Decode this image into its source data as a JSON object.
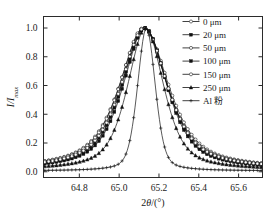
{
  "chart_data": {
    "type": "line",
    "title": "",
    "xlabel": "2θ/(°)",
    "ylabel": "I/I",
    "ylabel_sub": "max",
    "xlim": [
      64.62,
      65.72
    ],
    "ylim": [
      -0.04,
      1.08
    ],
    "xticks": [
      64.8,
      65.0,
      65.2,
      65.4,
      65.6
    ],
    "xtick_labels": [
      "64.8",
      "65.0",
      "65.2",
      "65.4",
      "65.6"
    ],
    "yticks": [
      0.0,
      0.2,
      0.4,
      0.6,
      0.8,
      1.0
    ],
    "ytick_labels": [
      "0.0",
      "0.2",
      "0.4",
      "0.6",
      "0.8",
      "1.0"
    ],
    "grid": false,
    "legend_position": "top-right",
    "peak_center": 65.13,
    "series": [
      {
        "name": "0 μm",
        "marker": "open-circle",
        "fwhm": 0.295,
        "center": 65.125,
        "amplitude": 1.0,
        "baseline": 0.018,
        "shape": 0.72
      },
      {
        "name": "20 μm",
        "marker": "filled-square",
        "fwhm": 0.272,
        "center": 65.128,
        "amplitude": 1.0,
        "baseline": 0.016,
        "shape": 0.7
      },
      {
        "name": "50 μm",
        "marker": "open-circle",
        "fwhm": 0.286,
        "center": 65.122,
        "amplitude": 1.0,
        "baseline": 0.018,
        "shape": 0.72
      },
      {
        "name": "100 μm",
        "marker": "filled-square",
        "fwhm": 0.262,
        "center": 65.13,
        "amplitude": 1.0,
        "baseline": 0.015,
        "shape": 0.68
      },
      {
        "name": "150 μm",
        "marker": "open-circle",
        "fwhm": 0.278,
        "center": 65.126,
        "amplitude": 1.0,
        "baseline": 0.017,
        "shape": 0.71
      },
      {
        "name": "250 μm",
        "marker": "filled-triangle",
        "fwhm": 0.215,
        "center": 65.133,
        "amplitude": 1.0,
        "baseline": 0.012,
        "shape": 0.6
      },
      {
        "name": "Al 粉",
        "marker": "cross",
        "fwhm": 0.105,
        "center": 65.137,
        "amplitude": 1.0,
        "baseline": 0.006,
        "shape": 0.35
      }
    ]
  },
  "legend": {
    "entries": [
      {
        "label": "0 μm"
      },
      {
        "label": "20 μm"
      },
      {
        "label": "50 μm"
      },
      {
        "label": "100 μm"
      },
      {
        "label": "150 μm"
      },
      {
        "label": "250 μm"
      },
      {
        "label": "Al 粉"
      }
    ]
  },
  "axes": {
    "x_title": "2θ/(°)",
    "y_title": "I/I",
    "y_title_sub": "max",
    "x_ticks": [
      "64.8",
      "65.0",
      "65.2",
      "65.4",
      "65.6"
    ],
    "y_ticks": [
      "0.0",
      "0.2",
      "0.4",
      "0.6",
      "0.8",
      "1.0"
    ]
  },
  "colors": {
    "line": "#111111",
    "frame": "#2b2b2b",
    "background": "#ffffff"
  }
}
